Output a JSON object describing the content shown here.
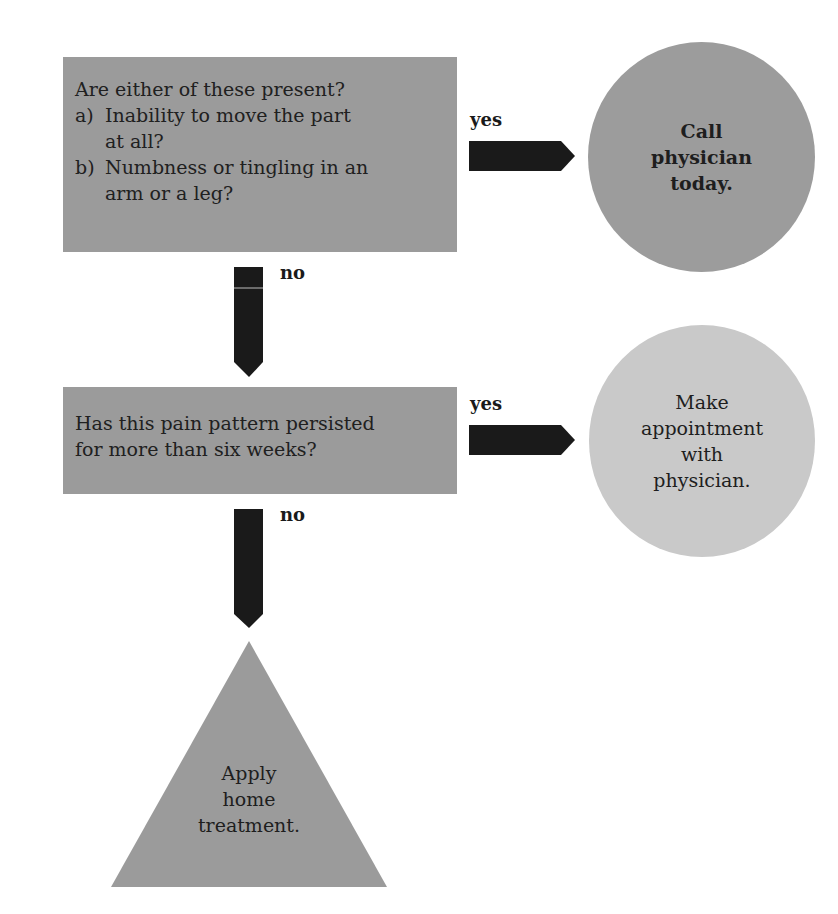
{
  "diagram": {
    "type": "flowchart",
    "colors": {
      "decision_box": "#9b9b9b",
      "urgent_outcome": "#9c9c9c",
      "routine_outcome": "#c9c9c9",
      "home_outcome": "#9b9b9b",
      "arrow": "#1a1a1a"
    },
    "question1": {
      "title": "Are either of these present?",
      "items": [
        {
          "marker": "a)",
          "lines": [
            "Inability to move the part",
            "at all?"
          ]
        },
        {
          "marker": "b)",
          "lines": [
            "Numbness or tingling in an",
            "arm or a leg?"
          ]
        }
      ]
    },
    "question2": {
      "lines": [
        "Has this pain pattern persisted",
        "for more than six weeks?"
      ]
    },
    "edges": {
      "q1_yes": "yes",
      "q1_no": "no",
      "q2_yes": "yes",
      "q2_no": "no"
    },
    "outcome_urgent": {
      "lines": [
        "Call",
        "physician",
        "today."
      ]
    },
    "outcome_appointment": {
      "lines": [
        "Make",
        "appointment",
        "with",
        "physician."
      ]
    },
    "outcome_home": {
      "lines": [
        "Apply",
        "home",
        "treatment."
      ]
    }
  }
}
